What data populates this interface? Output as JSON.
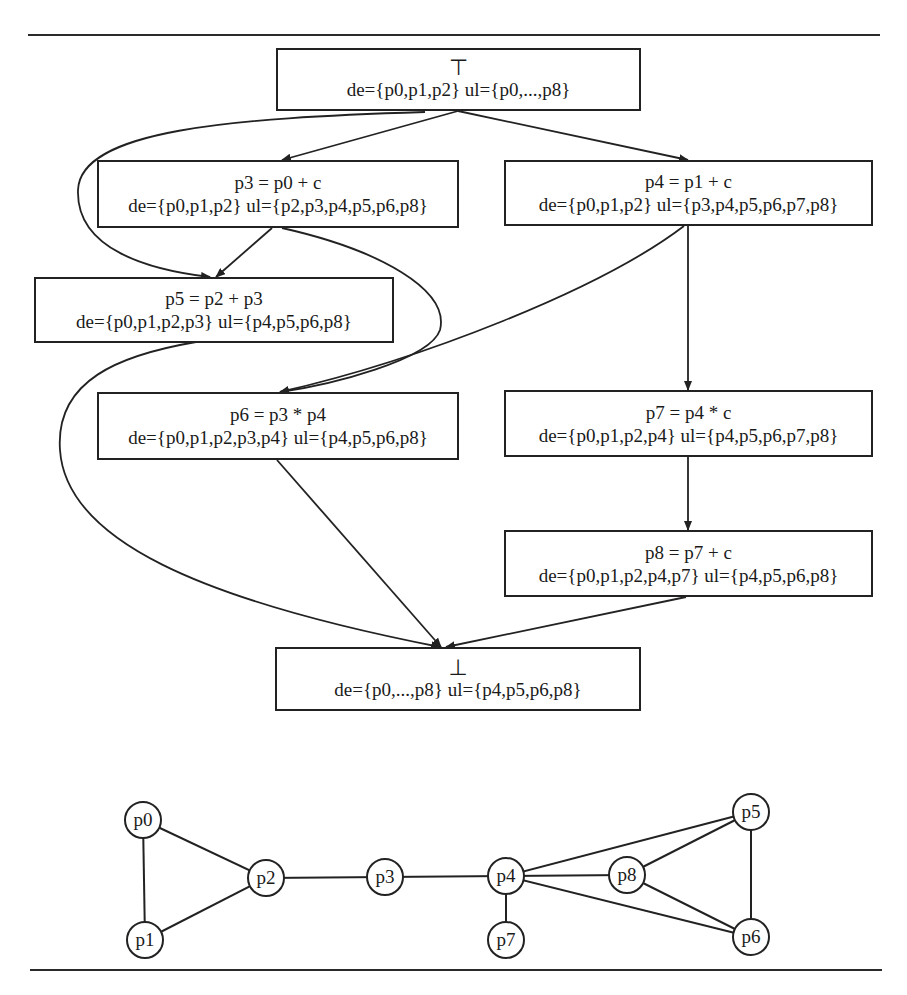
{
  "top_node": {
    "symbol": "⊤",
    "de": "de={p0,p1,p2}",
    "ul": "ul={p0,...,p8}"
  },
  "nodes": [
    {
      "id": "p3",
      "stmt": "p3 = p0 + c",
      "de": "de={p0,p1,p2}",
      "ul": "ul={p2,p3,p4,p5,p6,p8}"
    },
    {
      "id": "p4",
      "stmt": "p4 = p1 + c",
      "de": "de={p0,p1,p2}",
      "ul": "ul={p3,p4,p5,p6,p7,p8}"
    },
    {
      "id": "p5",
      "stmt": "p5 = p2 + p3",
      "de": "de={p0,p1,p2,p3}",
      "ul": "ul={p4,p5,p6,p8}"
    },
    {
      "id": "p6",
      "stmt": "p6 = p3 * p4",
      "de": "de={p0,p1,p2,p3,p4}",
      "ul": "ul={p4,p5,p6,p8}"
    },
    {
      "id": "p7",
      "stmt": "p7 = p4 * c",
      "de": "de={p0,p1,p2,p4}",
      "ul": "ul={p4,p5,p6,p7,p8}"
    },
    {
      "id": "p8",
      "stmt": "p8 = p7 + c",
      "de": "de={p0,p1,p2,p4,p7}",
      "ul": "ul={p4,p5,p6,p8}"
    }
  ],
  "bottom_node": {
    "symbol": "⊥",
    "de": "de={p0,...,p8}",
    "ul": "ul={p4,p5,p6,p8}"
  },
  "flow_edges": [
    [
      "top",
      "p3"
    ],
    [
      "top",
      "p4"
    ],
    [
      "top",
      "p5"
    ],
    [
      "p3",
      "p5"
    ],
    [
      "p3",
      "p6"
    ],
    [
      "p4",
      "p6"
    ],
    [
      "p4",
      "p7"
    ],
    [
      "p5",
      "bottom"
    ],
    [
      "p6",
      "bottom"
    ],
    [
      "p7",
      "p8"
    ],
    [
      "p8",
      "bottom"
    ]
  ],
  "interference_graph": {
    "nodes": [
      {
        "label": "p0",
        "x": 143,
        "y": 820
      },
      {
        "label": "p1",
        "x": 145,
        "y": 940
      },
      {
        "label": "p2",
        "x": 266,
        "y": 878
      },
      {
        "label": "p3",
        "x": 385,
        "y": 877
      },
      {
        "label": "p4",
        "x": 506,
        "y": 876
      },
      {
        "label": "p7",
        "x": 506,
        "y": 940
      },
      {
        "label": "p8",
        "x": 627,
        "y": 875
      },
      {
        "label": "p5",
        "x": 751,
        "y": 812
      },
      {
        "label": "p6",
        "x": 751,
        "y": 937
      }
    ],
    "edges": [
      [
        "p0",
        "p1"
      ],
      [
        "p0",
        "p2"
      ],
      [
        "p1",
        "p2"
      ],
      [
        "p2",
        "p3"
      ],
      [
        "p3",
        "p4"
      ],
      [
        "p4",
        "p7"
      ],
      [
        "p4",
        "p8"
      ],
      [
        "p4",
        "p5"
      ],
      [
        "p4",
        "p6"
      ],
      [
        "p8",
        "p5"
      ],
      [
        "p8",
        "p6"
      ],
      [
        "p5",
        "p6"
      ]
    ]
  }
}
